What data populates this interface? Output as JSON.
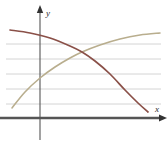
{
  "figure": {
    "title": "",
    "axis_labels": {
      "x": "x",
      "y": "y"
    },
    "colors": {
      "axis": "#555555",
      "gridline": "#cfcfcf",
      "descending_curve": "#8a5048",
      "ascending_curve": "#b9ae8e",
      "background": "#ffffff"
    }
  },
  "chart_data": {
    "type": "line",
    "title": "",
    "xlabel": "x",
    "ylabel": "y",
    "grid": true,
    "legend": "none",
    "xlim": [
      0,
      167
    ],
    "ylim": [
      0,
      145
    ],
    "gridlines_y": [
      44,
      59,
      74,
      89,
      104
    ],
    "axes": {
      "x_axis_y": 118,
      "y_axis_x": 40,
      "x_axis_from": 0,
      "x_axis_to": 162,
      "y_axis_from": 140,
      "y_axis_to": 10
    },
    "intersection": {
      "x": 82,
      "y": 52
    },
    "series": [
      {
        "name": "descending-curve",
        "color": "#8a5048",
        "points": [
          [
            10,
            30
          ],
          [
            30,
            33
          ],
          [
            50,
            38
          ],
          [
            70,
            46
          ],
          [
            82,
            52
          ],
          [
            95,
            61
          ],
          [
            110,
            74
          ],
          [
            125,
            90
          ],
          [
            138,
            103
          ],
          [
            148,
            112
          ]
        ]
      },
      {
        "name": "ascending-curve",
        "color": "#b9ae8e",
        "points": [
          [
            12,
            108
          ],
          [
            25,
            92
          ],
          [
            40,
            78
          ],
          [
            55,
            67
          ],
          [
            70,
            58
          ],
          [
            82,
            52
          ],
          [
            100,
            45
          ],
          [
            120,
            39
          ],
          [
            140,
            35
          ],
          [
            160,
            33
          ]
        ]
      }
    ]
  }
}
